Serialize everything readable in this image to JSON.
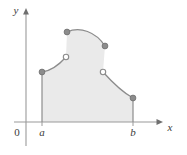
{
  "figure": {
    "background_color": "#ffffff",
    "axes": {
      "x_axis_label": "x",
      "y_axis_label": "y",
      "origin_label": "0",
      "axis_color": "#9a9a9a",
      "label_color": "#3b3b3b",
      "x_axis_y_px": 122,
      "y_axis_x_px": 26,
      "x_axis_start_px": 14,
      "x_axis_end_px": 163,
      "y_axis_top_px": 10,
      "y_axis_bottom_px": 146
    },
    "ticks": [
      {
        "label": "a",
        "x_px": 42
      },
      {
        "label": "b",
        "x_px": 133
      }
    ],
    "region": {
      "fill_color": "#eaeaea",
      "stroke_color": "#8c8c8c",
      "left_boundary_x_px": 42,
      "right_boundary_x_px": 133,
      "baseline_y_px": 122
    },
    "curve_segments": [
      {
        "name": "segment-1-rising",
        "start": {
          "x_px": 42,
          "y_px": 72
        },
        "end": {
          "x_px": 66,
          "y_px": 57
        }
      },
      {
        "name": "segment-2-top-arc",
        "start": {
          "x_px": 67,
          "y_px": 32
        },
        "end": {
          "x_px": 105,
          "y_px": 46
        }
      },
      {
        "name": "segment-3-falling",
        "start": {
          "x_px": 103,
          "y_px": 72
        },
        "end": {
          "x_px": 133,
          "y_px": 98
        }
      }
    ],
    "endpoints": [
      {
        "name": "closed-point-left-lower",
        "type": "filled",
        "x_px": 42,
        "y_px": 72
      },
      {
        "name": "open-point-left-upper",
        "type": "open",
        "x_px": 66,
        "y_px": 57
      },
      {
        "name": "closed-point-arc-left",
        "type": "filled",
        "x_px": 67,
        "y_px": 32
      },
      {
        "name": "closed-point-arc-right",
        "type": "filled",
        "x_px": 105,
        "y_px": 46
      },
      {
        "name": "open-point-right-upper",
        "type": "open",
        "x_px": 103,
        "y_px": 72
      },
      {
        "name": "closed-point-right-lower",
        "type": "filled",
        "x_px": 133,
        "y_px": 98
      }
    ],
    "marker_style": {
      "filled_fill": "#8c8c8c",
      "filled_stroke": "#6f6f6f",
      "open_fill": "#ffffff",
      "open_stroke": "#8c8c8c",
      "radius_px": 3
    }
  }
}
